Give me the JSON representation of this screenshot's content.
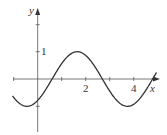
{
  "chart_data": {
    "type": "line",
    "title": "",
    "xlabel": "x",
    "ylabel": "y",
    "xlim": [
      -1.05,
      4.95
    ],
    "ylim": [
      -2,
      2.8
    ],
    "x_ticks": [
      -1,
      1,
      2,
      3,
      4
    ],
    "x_tick_labels": [
      "2",
      "4"
    ],
    "y_ticks": [
      -1,
      1
    ],
    "y_tick_labels": [
      "1"
    ],
    "grid": false,
    "series": [
      {
        "name": "curve",
        "function": "y = sin(1.5(x - 0.6))",
        "x": [
          -1.0,
          -0.5,
          -0.45,
          0,
          0.6,
          1.0,
          1.65,
          2.0,
          2.7,
          3.0,
          3.74,
          4.0,
          4.5,
          4.9
        ],
        "y": [
          -0.63,
          -0.99,
          -1.0,
          -0.78,
          0,
          0.57,
          1.0,
          0.86,
          0,
          -0.44,
          -1.0,
          -0.92,
          -0.38,
          0.2
        ]
      }
    ]
  },
  "axes": {
    "x_label": "x",
    "y_label": "y",
    "tick_label_2": "2",
    "tick_label_4": "4",
    "tick_label_y1": "1"
  },
  "colors": {
    "axis": "#444444",
    "curve": "#333333"
  }
}
